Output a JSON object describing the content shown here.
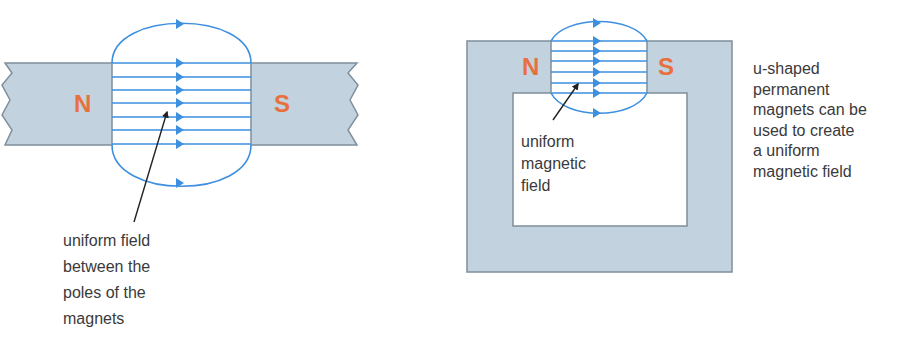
{
  "left_diagram": {
    "north_label": "N",
    "south_label": "S",
    "annotation": [
      "uniform field",
      "between the",
      "poles of the",
      "magnets"
    ]
  },
  "right_diagram": {
    "north_label": "N",
    "south_label": "S",
    "annotation": [
      "uniform",
      "magnetic",
      "field"
    ],
    "caption": [
      "u-shaped",
      "permanent",
      "magnets can be",
      "used to create",
      "a uniform",
      "magnetic field"
    ]
  },
  "colors": {
    "magnet_fill": "#c2d3df",
    "magnet_edge": "#7f8f9b",
    "field_line": "#3d8fe0",
    "pole_text": "#e8703e",
    "text": "#3a3a3a"
  }
}
